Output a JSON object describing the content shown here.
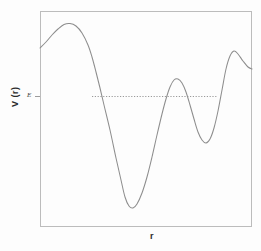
{
  "chart_data": {
    "type": "line",
    "title": "",
    "xlabel": "r",
    "ylabel": "V (r)",
    "grid": false,
    "legend": null,
    "axis_ticks": {
      "x": [],
      "y": [
        "E"
      ]
    },
    "annotations": [
      {
        "name": "energy-level-label",
        "text": "E",
        "x": 27,
        "y": 96,
        "style": "italic"
      },
      {
        "name": "energy-level-line",
        "text": "",
        "style": "dotted-horizontal",
        "y_value": 96.5,
        "x_start": 92,
        "x_end": 217
      }
    ],
    "axis_ranges": {
      "xlim": [
        0,
        1
      ],
      "ylim": [
        0,
        1
      ]
    },
    "series": [
      {
        "name": "potential-curve",
        "color": "#8a8a8a",
        "points_px": [
          [
            40,
            48
          ],
          [
            46,
            42
          ],
          [
            52,
            35
          ],
          [
            58,
            29
          ],
          [
            64,
            24.5
          ],
          [
            70,
            23.5
          ],
          [
            76,
            26
          ],
          [
            82,
            33
          ],
          [
            88,
            45
          ],
          [
            92,
            57
          ],
          [
            96,
            72
          ],
          [
            100,
            88
          ],
          [
            104,
            105
          ],
          [
            110,
            130
          ],
          [
            116,
            158
          ],
          [
            121,
            180
          ],
          [
            125,
            197
          ],
          [
            129,
            206
          ],
          [
            133,
            208
          ],
          [
            137,
            204
          ],
          [
            142,
            193
          ],
          [
            147,
            177
          ],
          [
            152,
            157
          ],
          [
            157,
            135
          ],
          [
            162,
            114
          ],
          [
            166,
            99
          ],
          [
            170,
            87
          ],
          [
            174,
            80
          ],
          [
            178,
            79
          ],
          [
            182,
            83
          ],
          [
            186,
            92
          ],
          [
            190,
            105
          ],
          [
            194,
            119
          ],
          [
            198,
            132
          ],
          [
            202,
            140
          ],
          [
            206,
            143
          ],
          [
            210,
            139
          ],
          [
            214,
            128
          ],
          [
            218,
            111
          ],
          [
            222,
            90
          ],
          [
            226,
            69
          ],
          [
            230,
            56
          ],
          [
            234,
            51
          ],
          [
            238,
            54
          ],
          [
            243,
            61
          ],
          [
            248,
            67
          ],
          [
            252,
            69
          ]
        ]
      }
    ]
  },
  "frame": {
    "left": 40,
    "top": 11,
    "right": 252,
    "bottom": 227,
    "border_color": "#b9b9b9"
  },
  "colors": {
    "curve": "#8d8d8d",
    "frame": "#bcbcbc",
    "dotted": "#9a9a9a",
    "text": "#2b2b2b",
    "background": "#fdfdfd"
  }
}
